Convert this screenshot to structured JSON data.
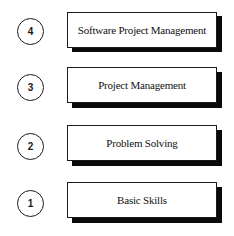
{
  "diagram": {
    "type": "stacked-levels",
    "levels": [
      {
        "number": "4",
        "label": "Software Project Management"
      },
      {
        "number": "3",
        "label": "Project Management"
      },
      {
        "number": "2",
        "label": "Problem Solving"
      },
      {
        "number": "1",
        "label": "Basic Skills"
      }
    ],
    "colors": {
      "background": "#ffffff",
      "outline": "#1a1a1a",
      "shadow": "#0a0a0a",
      "text": "#111111"
    }
  }
}
